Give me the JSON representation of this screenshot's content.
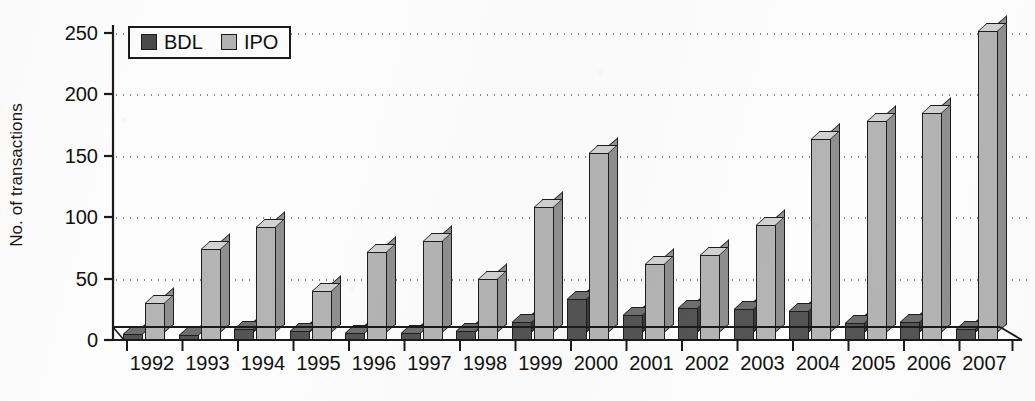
{
  "chart_data": {
    "type": "bar",
    "title": "",
    "xlabel": "",
    "ylabel": "No. of transactions",
    "categories": [
      "1992",
      "1993",
      "1994",
      "1995",
      "1996",
      "1997",
      "1998",
      "1999",
      "2000",
      "2001",
      "2002",
      "2003",
      "2004",
      "2005",
      "2006",
      "2007"
    ],
    "series": [
      {
        "name": "BDL",
        "color": "#4a4a4a",
        "values": [
          5,
          4,
          9,
          7,
          6,
          6,
          7,
          15,
          33,
          20,
          26,
          25,
          24,
          14,
          15,
          9
        ]
      },
      {
        "name": "IPO",
        "color": "#b2b2b2",
        "values": [
          30,
          74,
          92,
          40,
          72,
          81,
          50,
          108,
          152,
          62,
          69,
          94,
          164,
          178,
          185,
          252
        ]
      }
    ],
    "ylim": [
      0,
      250
    ],
    "yticks": [
      0,
      50,
      100,
      150,
      200,
      250
    ],
    "ytick_labels": [
      "0",
      "50",
      "100",
      "150",
      "200",
      "250"
    ],
    "grid": "horizontal-dotted",
    "legend_position": "top-left-inside",
    "style": "3d-extruded-bars-grayscale"
  },
  "legend": {
    "entries": [
      {
        "label": "BDL",
        "swatch": "dark-gray-square"
      },
      {
        "label": "IPO",
        "swatch": "light-gray-square"
      }
    ]
  },
  "axes": {
    "y_title": "No. of transactions",
    "y_tick_labels": [
      "250",
      "200",
      "150",
      "100",
      "50",
      "0"
    ],
    "x_tick_labels": [
      "1992",
      "1993",
      "1994",
      "1995",
      "1996",
      "1997",
      "1998",
      "1999",
      "2000",
      "2001",
      "2002",
      "2003",
      "2004",
      "2005",
      "2006",
      "2007"
    ]
  },
  "colors": {
    "bdl_face": "#545454",
    "ipo_face": "#b4b4b4",
    "axis": "#1a1a1a",
    "grid": "#888888",
    "background": "#fdfdfd"
  }
}
